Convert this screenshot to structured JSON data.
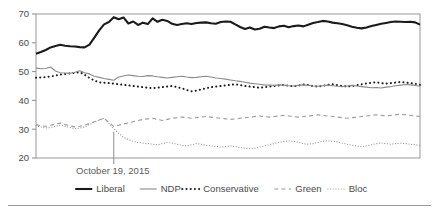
{
  "chart_data": {
    "type": "line",
    "title": "",
    "xlabel": "",
    "ylabel": "",
    "ylim": [
      20,
      70
    ],
    "yticks": [
      20,
      30,
      40,
      50,
      60,
      70
    ],
    "grid": false,
    "legend_position": "bottom",
    "annotations": [
      {
        "label": "October 19, 2015",
        "x_index": 16,
        "type": "vertical-marker"
      }
    ],
    "x": [
      0,
      1,
      2,
      3,
      4,
      5,
      6,
      7,
      8,
      9,
      10,
      11,
      12,
      13,
      14,
      15,
      16,
      17,
      18,
      19,
      20,
      21,
      22,
      23,
      24,
      25,
      26,
      27,
      28,
      29,
      30,
      31,
      32,
      33,
      34,
      35,
      36,
      37,
      38,
      39,
      40,
      41,
      42,
      43,
      44,
      45,
      46,
      47,
      48,
      49,
      50,
      51,
      52,
      53,
      54,
      55,
      56,
      57,
      58,
      59,
      60,
      61,
      62,
      63,
      64,
      65,
      66,
      67,
      68,
      69,
      70,
      71,
      72,
      73,
      74,
      75,
      76,
      77,
      78,
      79
    ],
    "series": [
      {
        "name": "Liberal",
        "color": "#1a1a1a",
        "style": "solid-thick",
        "values": [
          56.2,
          56.8,
          57.5,
          58.4,
          58.9,
          59.3,
          59.0,
          58.8,
          58.7,
          58.5,
          58.4,
          59.4,
          61.8,
          64.3,
          66.4,
          67.2,
          68.9,
          68.2,
          68.8,
          66.7,
          67.4,
          66.2,
          67.0,
          66.5,
          68.5,
          67.3,
          68.0,
          67.6,
          66.6,
          66.2,
          66.5,
          66.8,
          66.5,
          66.9,
          67.0,
          67.1,
          66.8,
          66.6,
          67.2,
          67.4,
          67.3,
          66.4,
          65.5,
          64.8,
          65.3,
          64.6,
          64.9,
          65.6,
          65.3,
          65.1,
          65.7,
          65.9,
          65.4,
          65.8,
          66.0,
          65.7,
          66.3,
          66.9,
          67.2,
          67.6,
          67.4,
          67.0,
          66.8,
          66.5,
          66.1,
          65.6,
          65.2,
          65.0,
          65.3,
          65.8,
          66.2,
          66.6,
          66.9,
          67.2,
          67.4,
          67.3,
          67.2,
          67.3,
          67.1,
          66.3
        ]
      },
      {
        "name": "NDP",
        "color": "#8a8a8a",
        "style": "solid-thin",
        "values": [
          51.2,
          51.0,
          51.1,
          51.6,
          50.2,
          49.6,
          49.5,
          49.4,
          49.8,
          50.3,
          49.6,
          49.2,
          48.4,
          48.0,
          47.6,
          47.3,
          47.0,
          48.1,
          48.5,
          48.8,
          48.6,
          48.4,
          48.3,
          48.6,
          48.5,
          48.2,
          48.0,
          47.8,
          48.0,
          48.2,
          48.4,
          48.1,
          47.9,
          48.0,
          48.2,
          48.4,
          48.1,
          47.8,
          47.6,
          47.4,
          47.1,
          46.8,
          46.6,
          46.3,
          46.0,
          45.8,
          45.6,
          45.4,
          45.3,
          45.2,
          45.4,
          45.3,
          45.1,
          45.0,
          45.2,
          45.4,
          45.2,
          45.0,
          44.9,
          45.1,
          45.3,
          45.1,
          44.9,
          44.8,
          45.0,
          45.2,
          45.0,
          44.8,
          44.6,
          44.4,
          44.5,
          44.3,
          44.6,
          44.8,
          45.1,
          45.3,
          45.5,
          45.4,
          45.2,
          44.9
        ]
      },
      {
        "name": "Conservative",
        "color": "#1a1a1a",
        "style": "dotted-bold",
        "values": [
          47.9,
          48.0,
          48.1,
          48.3,
          48.6,
          49.0,
          49.2,
          49.4,
          49.6,
          49.8,
          48.9,
          47.8,
          46.9,
          46.3,
          46.1,
          46.0,
          45.8,
          45.6,
          45.4,
          45.2,
          45.0,
          44.8,
          44.6,
          44.4,
          44.3,
          44.4,
          44.6,
          44.8,
          45.0,
          44.6,
          44.2,
          43.6,
          43.2,
          43.4,
          43.8,
          44.2,
          44.6,
          44.8,
          45.0,
          45.2,
          45.4,
          45.6,
          45.3,
          45.0,
          44.8,
          44.6,
          44.4,
          44.6,
          44.8,
          45.0,
          45.2,
          45.4,
          45.1,
          44.9,
          45.2,
          45.5,
          45.3,
          45.0,
          44.8,
          45.1,
          45.4,
          45.6,
          45.3,
          45.0,
          44.8,
          45.0,
          45.3,
          45.6,
          45.9,
          46.1,
          46.3,
          46.0,
          45.8,
          46.0,
          46.2,
          46.4,
          46.2,
          46.0,
          45.8,
          45.4
        ]
      },
      {
        "name": "Green",
        "color": "#9a9a9a",
        "style": "dashed",
        "values": [
          31.6,
          31.2,
          31.0,
          31.4,
          31.8,
          32.1,
          31.6,
          31.2,
          30.8,
          31.0,
          31.4,
          32.0,
          32.6,
          33.2,
          33.8,
          32.4,
          31.0,
          31.4,
          31.8,
          32.2,
          32.6,
          33.0,
          33.4,
          33.6,
          33.8,
          33.4,
          33.0,
          33.4,
          33.8,
          34.0,
          34.2,
          34.0,
          33.8,
          34.0,
          34.2,
          34.4,
          34.2,
          34.0,
          33.8,
          33.6,
          33.4,
          33.6,
          33.8,
          34.0,
          34.2,
          34.4,
          34.6,
          34.4,
          34.2,
          34.4,
          34.6,
          34.8,
          34.6,
          34.4,
          34.2,
          34.4,
          34.6,
          34.8,
          35.0,
          34.8,
          34.6,
          34.4,
          34.2,
          34.0,
          33.8,
          34.0,
          34.2,
          34.4,
          34.6,
          34.8,
          35.0,
          34.8,
          34.6,
          34.8,
          35.0,
          35.2,
          35.0,
          34.8,
          34.6,
          34.4
        ]
      },
      {
        "name": "Bloc",
        "color": "#9a9a9a",
        "style": "fine-dotted",
        "values": [
          31.2,
          30.8,
          30.4,
          30.6,
          31.0,
          31.4,
          31.0,
          30.6,
          30.2,
          30.4,
          30.8,
          31.6,
          32.4,
          33.2,
          33.8,
          32.0,
          30.2,
          28.6,
          27.2,
          26.4,
          25.8,
          25.4,
          25.2,
          25.0,
          24.8,
          24.6,
          25.0,
          25.4,
          25.2,
          24.8,
          24.4,
          24.2,
          24.6,
          25.0,
          24.8,
          24.4,
          24.2,
          24.0,
          23.8,
          24.0,
          24.2,
          24.0,
          23.6,
          23.4,
          23.2,
          23.4,
          23.8,
          24.2,
          24.6,
          25.0,
          25.4,
          25.8,
          26.0,
          25.8,
          25.4,
          25.0,
          24.8,
          25.0,
          25.4,
          25.8,
          26.0,
          25.8,
          25.6,
          25.2,
          24.8,
          24.4,
          24.2,
          24.0,
          24.2,
          24.6,
          25.0,
          25.2,
          25.0,
          24.8,
          25.0,
          25.2,
          25.0,
          24.8,
          24.6,
          24.4
        ]
      }
    ],
    "legend": [
      {
        "label": "Liberal",
        "style": "solid-thick",
        "color": "#1a1a1a"
      },
      {
        "label": "NDP",
        "style": "solid-thin",
        "color": "#8a8a8a"
      },
      {
        "label": "Conservative",
        "style": "dotted-bold",
        "color": "#1a1a1a"
      },
      {
        "label": "Green",
        "style": "dashed",
        "color": "#9a9a9a"
      },
      {
        "label": "Bloc",
        "style": "fine-dotted",
        "color": "#9a9a9a"
      }
    ]
  }
}
